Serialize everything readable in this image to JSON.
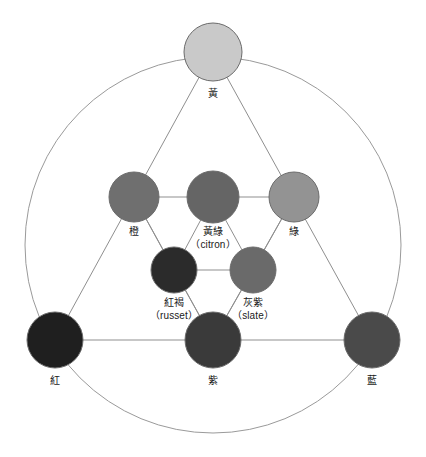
{
  "diagram": {
    "type": "color-wheel-triangles",
    "canvas": {
      "width": 426,
      "height": 457,
      "background": "#ffffff"
    },
    "outer_circle": {
      "cx": 213,
      "cy": 245,
      "r": 188,
      "stroke": "#9a9a9a",
      "stroke_width": 1
    },
    "line_stroke": "#8f8f8f",
    "line_width": 1,
    "node_stroke": "#6b6b6b",
    "nodes": [
      {
        "id": "yellow",
        "label": "黃",
        "sub": "",
        "cx": 213,
        "cy": 52,
        "r": 29,
        "fill": "#c9c9c9",
        "label_x": 213,
        "label_y": 88
      },
      {
        "id": "orange",
        "label": "橙",
        "sub": "",
        "cx": 134,
        "cy": 197,
        "r": 25,
        "fill": "#6f6f6f",
        "label_x": 134,
        "label_y": 226
      },
      {
        "id": "citron",
        "label": "黃綠",
        "sub": "（citron）",
        "cx": 213,
        "cy": 197,
        "r": 26,
        "fill": "#656565",
        "label_x": 213,
        "label_y": 226
      },
      {
        "id": "green",
        "label": "綠",
        "sub": "",
        "cx": 294,
        "cy": 197,
        "r": 25,
        "fill": "#939393",
        "label_x": 294,
        "label_y": 226
      },
      {
        "id": "russet",
        "label": "紅褐",
        "sub": "（russet）",
        "cx": 174,
        "cy": 270,
        "r": 23,
        "fill": "#2b2b2b",
        "label_x": 174,
        "label_y": 297
      },
      {
        "id": "slate",
        "label": "灰紫",
        "sub": "（slate）",
        "cx": 253,
        "cy": 270,
        "r": 23,
        "fill": "#6a6a6a",
        "label_x": 253,
        "label_y": 297
      },
      {
        "id": "red",
        "label": "紅",
        "sub": "",
        "cx": 55,
        "cy": 340,
        "r": 28,
        "fill": "#1f1f1f",
        "label_x": 55,
        "label_y": 375
      },
      {
        "id": "purple",
        "label": "紫",
        "sub": "",
        "cx": 213,
        "cy": 340,
        "r": 28,
        "fill": "#3a3a3a",
        "label_x": 213,
        "label_y": 375
      },
      {
        "id": "blue",
        "label": "藍",
        "sub": "",
        "cx": 372,
        "cy": 340,
        "r": 28,
        "fill": "#4a4a4a",
        "label_x": 372,
        "label_y": 375
      }
    ],
    "edges": [
      {
        "from": "yellow",
        "to": "red"
      },
      {
        "from": "yellow",
        "to": "blue"
      },
      {
        "from": "red",
        "to": "blue"
      },
      {
        "from": "orange",
        "to": "citron"
      },
      {
        "from": "citron",
        "to": "green"
      },
      {
        "from": "orange",
        "to": "purple"
      },
      {
        "from": "green",
        "to": "purple"
      },
      {
        "from": "russet",
        "to": "slate"
      },
      {
        "from": "russet",
        "to": "citron"
      },
      {
        "from": "slate",
        "to": "citron"
      },
      {
        "from": "russet",
        "to": "orange"
      },
      {
        "from": "slate",
        "to": "green"
      },
      {
        "from": "russet",
        "to": "purple"
      },
      {
        "from": "slate",
        "to": "purple"
      }
    ]
  }
}
